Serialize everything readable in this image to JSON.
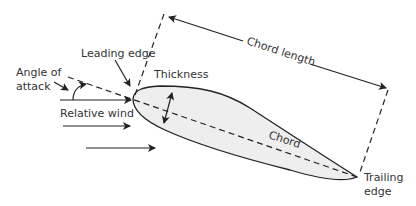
{
  "diagram": {
    "labels": {
      "leading_edge": "Leading edge",
      "angle_of_attack_line1": "Angle of",
      "angle_of_attack_line2": "attack",
      "relative_wind": "Relative wind",
      "thickness": "Thickness",
      "chord_length": "Chord length",
      "chord": "Chord",
      "trailing_edge_line1": "Trailing",
      "trailing_edge_line2": "edge"
    },
    "colors": {
      "line": "#222222",
      "text": "#333333",
      "airfoil_fill": "#eeeeee",
      "background": "#ffffff"
    }
  }
}
